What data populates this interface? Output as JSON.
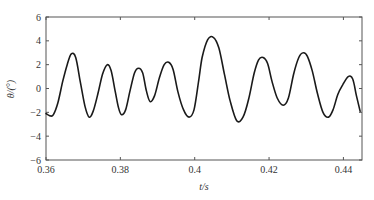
{
  "chart_data": {
    "type": "line",
    "title": "",
    "xlabel": "t/s",
    "ylabel": "θ/(°)",
    "xlim": [
      0.36,
      0.445
    ],
    "ylim": [
      -6,
      6
    ],
    "grid": false,
    "legend": null,
    "x_ticks": [
      0.36,
      0.38,
      0.4,
      0.42,
      0.44
    ],
    "x_tick_labels": [
      "0.36",
      "0.38",
      "0.4",
      "0.42",
      "0.44"
    ],
    "y_ticks": [
      -6,
      -4,
      -2,
      0,
      2,
      4,
      6
    ],
    "y_tick_labels": [
      "−6",
      "−4",
      "−2",
      "0",
      "2",
      "4",
      "6"
    ],
    "colors": {
      "line": "#1a1a1a",
      "axis": "#555555"
    },
    "series": [
      {
        "name": "theta",
        "x": [
          0.36,
          0.3611,
          0.362,
          0.3632,
          0.3645,
          0.3657,
          0.3668,
          0.368,
          0.3692,
          0.3705,
          0.3716,
          0.3727,
          0.374,
          0.3752,
          0.3765,
          0.3775,
          0.3786,
          0.3795,
          0.3803,
          0.3814,
          0.3826,
          0.3838,
          0.3849,
          0.386,
          0.387,
          0.388,
          0.3892,
          0.3905,
          0.3918,
          0.393,
          0.3942,
          0.3955,
          0.397,
          0.3985,
          0.3998,
          0.401,
          0.402,
          0.4035,
          0.405,
          0.4065,
          0.408,
          0.4095,
          0.4113,
          0.413,
          0.4145,
          0.416,
          0.4172,
          0.4184,
          0.4196,
          0.4208,
          0.4222,
          0.4238,
          0.4252,
          0.4266,
          0.428,
          0.4292,
          0.4303,
          0.4316,
          0.433,
          0.4345,
          0.436,
          0.4372,
          0.4385,
          0.4398,
          0.4413,
          0.4425,
          0.4435,
          0.4445
        ],
        "values": [
          -2.1,
          -2.3,
          -2.2,
          -1.2,
          0.6,
          2.0,
          2.9,
          2.6,
          0.6,
          -1.5,
          -2.4,
          -1.9,
          -0.4,
          1.2,
          2.0,
          1.5,
          -0.2,
          -1.6,
          -2.2,
          -1.8,
          -0.2,
          1.3,
          1.7,
          1.3,
          -0.2,
          -1.1,
          -0.6,
          0.9,
          2.0,
          2.2,
          1.6,
          -0.3,
          -1.8,
          -2.4,
          -1.8,
          0.5,
          2.6,
          4.1,
          4.3,
          3.4,
          1.2,
          -1.0,
          -2.7,
          -2.4,
          -0.9,
          1.3,
          2.4,
          2.6,
          2.1,
          0.6,
          -0.8,
          -1.4,
          -0.8,
          1.2,
          2.6,
          3.0,
          2.7,
          1.5,
          -0.4,
          -2.0,
          -2.4,
          -1.8,
          -0.5,
          0.3,
          1.0,
          0.8,
          -0.6,
          -1.9
        ]
      }
    ]
  },
  "axes": {
    "xlabel": "t/s",
    "ylabel": "θ/(°)"
  }
}
